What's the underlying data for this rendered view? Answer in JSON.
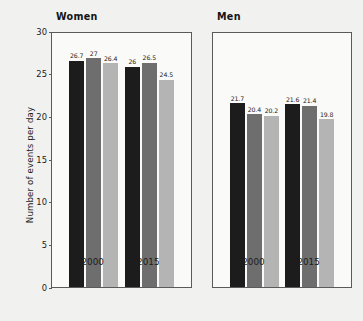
{
  "chart_data": {
    "type": "bar",
    "title": "",
    "xlabel": "",
    "ylabel": "Number of events per day",
    "ylim": [
      0,
      30
    ],
    "yticks": [
      0,
      5,
      10,
      15,
      20,
      25,
      30
    ],
    "ytick_labels": [
      "0",
      "5",
      "10",
      "15",
      "20",
      "25",
      "30"
    ],
    "categories": [
      "2000",
      "2015"
    ],
    "grid": false,
    "legend": "none",
    "panels": [
      {
        "name": "women",
        "title": "Women",
        "groups": [
          {
            "category": "2000",
            "bars": [
              {
                "value": 26.7,
                "label": "26.7",
                "color": "#1c1c1c"
              },
              {
                "value": 27.0,
                "label": "27",
                "color": "#6e6e6e"
              },
              {
                "value": 26.4,
                "label": "26.4",
                "color": "#b4b4b4"
              }
            ]
          },
          {
            "category": "2015",
            "bars": [
              {
                "value": 26.0,
                "label": "26",
                "color": "#1c1c1c"
              },
              {
                "value": 26.5,
                "label": "26.5",
                "color": "#6e6e6e"
              },
              {
                "value": 24.5,
                "label": "24.5",
                "color": "#b4b4b4"
              }
            ]
          }
        ]
      },
      {
        "name": "men",
        "title": "Men",
        "groups": [
          {
            "category": "2000",
            "bars": [
              {
                "value": 21.7,
                "label": "21.7",
                "color": "#1c1c1c"
              },
              {
                "value": 20.4,
                "label": "20.4",
                "color": "#6e6e6e"
              },
              {
                "value": 20.2,
                "label": "20.2",
                "color": "#b4b4b4"
              }
            ]
          },
          {
            "category": "2015",
            "bars": [
              {
                "value": 21.6,
                "label": "21.6",
                "color": "#1c1c1c"
              },
              {
                "value": 21.4,
                "label": "21.4",
                "color": "#6e6e6e"
              },
              {
                "value": 19.8,
                "label": "19.8",
                "color": "#b4b4b4"
              }
            ]
          }
        ]
      }
    ],
    "colors": {
      "series_1": "#1c1c1c",
      "series_2": "#6e6e6e",
      "series_3": "#b4b4b4",
      "background": "#f1f1ef",
      "plot_background": "#fafaf8",
      "axis": "#5a5a5a",
      "text": "#1c1c1c"
    }
  }
}
